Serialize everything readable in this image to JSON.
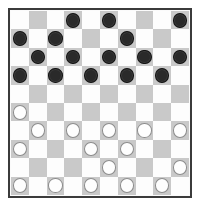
{
  "board": {
    "title": "Checkers board",
    "rows": 10,
    "cols": 10,
    "light_square_color": "#fdfdfd",
    "dark_square_color": "#c9c9c9",
    "border_color": "#3b3b3b",
    "black_piece_color": "#2a2a2a",
    "white_piece_color": "#fefefe",
    "white_piece_outline": "#9a9a9a",
    "black_piece_count": 16,
    "white_piece_count": 16,
    "piece_labels": {
      "black": "black-checker",
      "white": "white-checker",
      "empty": "empty-square"
    },
    "cells": [
      [
        "empty",
        "empty",
        "empty",
        "black",
        "empty",
        "black",
        "empty",
        "empty",
        "empty",
        "black"
      ],
      [
        "black",
        "empty",
        "black",
        "empty",
        "empty",
        "empty",
        "black",
        "empty",
        "empty",
        "empty"
      ],
      [
        "empty",
        "black",
        "empty",
        "black",
        "empty",
        "black",
        "empty",
        "black",
        "empty",
        "black"
      ],
      [
        "black",
        "empty",
        "black",
        "empty",
        "black",
        "empty",
        "black",
        "empty",
        "black",
        "empty"
      ],
      [
        "empty",
        "empty",
        "empty",
        "empty",
        "empty",
        "empty",
        "empty",
        "empty",
        "empty",
        "empty"
      ],
      [
        "white",
        "empty",
        "empty",
        "empty",
        "empty",
        "empty",
        "empty",
        "empty",
        "empty",
        "empty"
      ],
      [
        "empty",
        "white",
        "empty",
        "white",
        "empty",
        "white",
        "empty",
        "white",
        "empty",
        "white"
      ],
      [
        "white",
        "empty",
        "empty",
        "empty",
        "white",
        "empty",
        "white",
        "empty",
        "empty",
        "empty"
      ],
      [
        "empty",
        "empty",
        "empty",
        "empty",
        "empty",
        "white",
        "empty",
        "empty",
        "empty",
        "white"
      ],
      [
        "white",
        "empty",
        "white",
        "empty",
        "white",
        "empty",
        "white",
        "empty",
        "white",
        "empty"
      ]
    ]
  }
}
